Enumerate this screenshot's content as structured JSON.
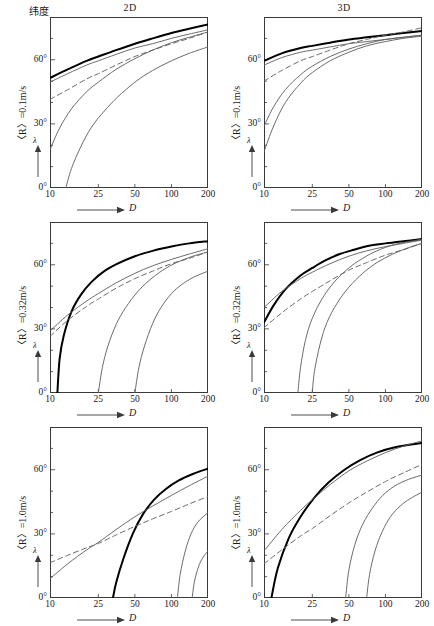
{
  "figure": {
    "width": 426,
    "height": 622,
    "top_left_label": "纬度",
    "column_headers": [
      "2D",
      "3D"
    ],
    "axis": {
      "x_name": "D",
      "y_name": "λ",
      "x_ticks": [
        "10",
        "25",
        "50",
        "100",
        "200"
      ],
      "x_tick_values": [
        10,
        25,
        50,
        100,
        200
      ],
      "y_ticks": [
        "0°",
        "30°",
        "60°"
      ],
      "y_tick_values": [
        0,
        30,
        60
      ],
      "x_scale": "log",
      "x_range": [
        10,
        200
      ],
      "y_range": [
        0,
        80
      ],
      "grid": false,
      "legend": "none"
    },
    "row_labels": [
      "〈R〉=0.1m/s",
      "〈R〉=0.32m/s",
      "〈R〉=1.0m/s"
    ],
    "colors": {
      "axis": "#3a3a3a",
      "thick_curve": "#000000",
      "thin_curve": "#5a5a5a",
      "dashed_curve": "#6a6a6a",
      "background": "#ffffff"
    }
  },
  "chart_data": [
    {
      "id": "panel-2d-r01",
      "type": "line",
      "title": "2D",
      "subtitle": "〈R〉=0.1m/s",
      "xlabel": "D",
      "ylabel": "λ",
      "xscale": "log",
      "xlim": [
        10,
        200
      ],
      "ylim": [
        0,
        80
      ],
      "x_ticks": [
        10,
        25,
        50,
        100,
        200
      ],
      "y_ticks": [
        0,
        30,
        60
      ],
      "series": [
        {
          "name": "thick-solid",
          "style": "thick-solid",
          "x": [
            10,
            14,
            20,
            25,
            35,
            50,
            70,
            100,
            140,
            200
          ],
          "y": [
            51.5,
            55.5,
            59.5,
            61.5,
            64.5,
            67.5,
            70.0,
            72.5,
            74.5,
            76.5
          ]
        },
        {
          "name": "thin-solid-upper",
          "style": "thin-solid",
          "x": [
            10,
            14,
            20,
            25,
            35,
            50,
            70,
            100,
            140,
            200
          ],
          "y": [
            49.5,
            53.5,
            57.5,
            59.5,
            62.5,
            65.5,
            67.5,
            70.0,
            72.0,
            74.0
          ]
        },
        {
          "name": "dashed",
          "style": "dashed",
          "x": [
            10,
            14,
            20,
            25,
            35,
            50,
            70,
            100,
            140,
            200
          ],
          "y": [
            41.5,
            46.0,
            51.0,
            53.5,
            57.5,
            61.5,
            64.5,
            67.5,
            70.0,
            73.0
          ]
        },
        {
          "name": "thin-solid-mid",
          "style": "thin-solid",
          "x": [
            10,
            12,
            15,
            20,
            25,
            35,
            50,
            70,
            100,
            140,
            200
          ],
          "y": [
            18.0,
            28.0,
            37.0,
            45.0,
            49.5,
            55.5,
            60.5,
            64.5,
            68.0,
            70.5,
            73.0
          ]
        },
        {
          "name": "thin-solid-lower",
          "style": "thin-solid",
          "x": [
            13.5,
            15,
            18,
            22,
            28,
            36,
            50,
            70,
            100,
            140,
            200
          ],
          "y": [
            0.0,
            9.0,
            19.5,
            28.5,
            36.0,
            42.5,
            49.5,
            55.0,
            59.5,
            63.0,
            66.0
          ]
        }
      ]
    },
    {
      "id": "panel-3d-r01",
      "type": "line",
      "title": "3D",
      "subtitle": "〈R〉=0.1m/s",
      "xlabel": "D",
      "ylabel": "λ",
      "xscale": "log",
      "xlim": [
        10,
        200
      ],
      "ylim": [
        0,
        80
      ],
      "x_ticks": [
        10,
        25,
        50,
        100,
        200
      ],
      "y_ticks": [
        0,
        30,
        60
      ],
      "series": [
        {
          "name": "thick-solid",
          "style": "thick-solid",
          "x": [
            10,
            14,
            20,
            25,
            35,
            50,
            70,
            100,
            140,
            200
          ],
          "y": [
            59.5,
            63.0,
            65.5,
            66.5,
            68.0,
            69.5,
            70.5,
            71.5,
            72.5,
            73.5
          ]
        },
        {
          "name": "thin-solid-upper",
          "style": "thin-solid",
          "x": [
            10,
            14,
            20,
            25,
            35,
            50,
            70,
            100,
            140,
            200
          ],
          "y": [
            57.5,
            61.0,
            63.5,
            64.5,
            66.0,
            67.5,
            68.5,
            69.5,
            70.5,
            71.5
          ]
        },
        {
          "name": "dashed",
          "style": "dashed",
          "x": [
            10,
            14,
            20,
            25,
            35,
            50,
            70,
            100,
            140,
            200
          ],
          "y": [
            50.0,
            55.0,
            59.5,
            61.5,
            64.5,
            67.5,
            69.5,
            71.5,
            73.0,
            75.0
          ]
        },
        {
          "name": "thin-solid-mid",
          "style": "thin-solid",
          "x": [
            10,
            12,
            15,
            20,
            25,
            35,
            50,
            70,
            100,
            140,
            200
          ],
          "y": [
            29.0,
            38.0,
            46.0,
            53.0,
            57.0,
            61.5,
            65.0,
            67.5,
            69.5,
            70.5,
            71.5
          ]
        },
        {
          "name": "thin-solid-lower",
          "style": "thin-solid",
          "x": [
            10,
            12,
            15,
            20,
            25,
            35,
            50,
            70,
            100,
            140,
            200
          ],
          "y": [
            17.0,
            29.0,
            40.0,
            49.0,
            54.0,
            59.5,
            63.5,
            66.5,
            68.5,
            70.0,
            71.0
          ]
        }
      ]
    },
    {
      "id": "panel-2d-r032",
      "type": "line",
      "title": "2D",
      "subtitle": "〈R〉=0.32m/s",
      "xlabel": "D",
      "ylabel": "λ",
      "xscale": "log",
      "xlim": [
        10,
        200
      ],
      "ylim": [
        0,
        80
      ],
      "x_ticks": [
        10,
        25,
        50,
        100,
        200
      ],
      "y_ticks": [
        0,
        30,
        60
      ],
      "series": [
        {
          "name": "thick-solid",
          "style": "thick-solid",
          "x": [
            11.5,
            12,
            13,
            15,
            18,
            22,
            28,
            36,
            50,
            70,
            100,
            140,
            200
          ],
          "y": [
            0.0,
            16.0,
            27.0,
            38.0,
            46.0,
            52.0,
            57.0,
            60.5,
            64.0,
            66.5,
            68.5,
            70.0,
            71.0
          ]
        },
        {
          "name": "thin-solid-upper",
          "style": "thin-solid",
          "x": [
            10,
            14,
            20,
            25,
            35,
            50,
            70,
            100,
            140,
            200
          ],
          "y": [
            29.0,
            36.5,
            43.0,
            46.5,
            51.5,
            56.0,
            59.5,
            62.5,
            65.0,
            67.5
          ]
        },
        {
          "name": "dashed",
          "style": "dashed",
          "x": [
            10,
            14,
            20,
            25,
            35,
            50,
            70,
            100,
            140,
            200
          ],
          "y": [
            26.5,
            34.0,
            40.5,
            44.0,
            49.0,
            53.5,
            57.0,
            60.5,
            63.0,
            66.0
          ]
        },
        {
          "name": "thin-solid-mid",
          "style": "thin-solid",
          "x": [
            25,
            27,
            30,
            35,
            42,
            52,
            65,
            85,
            110,
            150,
            200
          ],
          "y": [
            0.0,
            12.0,
            22.0,
            32.0,
            40.0,
            47.0,
            52.5,
            57.5,
            61.0,
            64.0,
            66.0
          ]
        },
        {
          "name": "thin-solid-lower",
          "style": "thin-solid",
          "x": [
            50,
            54,
            60,
            70,
            82,
            100,
            120,
            150,
            200
          ],
          "y": [
            0.0,
            12.0,
            22.0,
            32.5,
            40.0,
            46.5,
            50.5,
            54.0,
            57.0
          ]
        }
      ]
    },
    {
      "id": "panel-3d-r032",
      "type": "line",
      "title": "3D",
      "subtitle": "〈R〉=0.32m/s",
      "xlabel": "D",
      "ylabel": "λ",
      "xscale": "log",
      "xlim": [
        10,
        200
      ],
      "ylim": [
        0,
        80
      ],
      "x_ticks": [
        10,
        25,
        50,
        100,
        200
      ],
      "y_ticks": [
        0,
        30,
        60
      ],
      "series": [
        {
          "name": "thick-solid",
          "style": "thick-solid",
          "x": [
            10,
            12,
            15,
            20,
            25,
            32,
            42,
            55,
            75,
            100,
            140,
            200
          ],
          "y": [
            33.0,
            41.0,
            48.5,
            55.0,
            58.5,
            62.0,
            65.0,
            67.0,
            69.0,
            70.0,
            71.0,
            72.0
          ]
        },
        {
          "name": "thin-solid-upper",
          "style": "thin-solid",
          "x": [
            10,
            14,
            20,
            25,
            35,
            50,
            70,
            100,
            140,
            200
          ],
          "y": [
            40.0,
            47.5,
            53.5,
            56.5,
            60.5,
            64.0,
            66.5,
            68.5,
            70.0,
            71.5
          ]
        },
        {
          "name": "dashed",
          "style": "dashed",
          "x": [
            10,
            14,
            20,
            25,
            35,
            50,
            70,
            100,
            140,
            200
          ],
          "y": [
            30.5,
            37.5,
            44.0,
            47.5,
            52.5,
            57.5,
            61.0,
            64.5,
            67.0,
            70.0
          ]
        },
        {
          "name": "thin-solid-mid",
          "style": "thin-solid",
          "x": [
            19,
            20,
            22,
            25,
            30,
            38,
            50,
            65,
            85,
            120,
            200
          ],
          "y": [
            0.0,
            12.0,
            25.0,
            35.0,
            44.0,
            52.0,
            58.5,
            63.0,
            66.5,
            69.5,
            72.0
          ]
        },
        {
          "name": "thin-solid-lower",
          "style": "thin-solid",
          "x": [
            25,
            26,
            29,
            33,
            40,
            50,
            65,
            85,
            115,
            155,
            200
          ],
          "y": [
            0.0,
            10.0,
            23.0,
            33.0,
            42.0,
            49.5,
            56.0,
            61.0,
            65.0,
            68.0,
            70.0
          ]
        }
      ]
    },
    {
      "id": "panel-2d-r10",
      "type": "line",
      "title": "2D",
      "subtitle": "〈R〉=1.0m/s",
      "xlabel": "D",
      "ylabel": "λ",
      "xscale": "log",
      "xlim": [
        10,
        200
      ],
      "ylim": [
        0,
        80
      ],
      "x_ticks": [
        10,
        25,
        50,
        100,
        200
      ],
      "y_ticks": [
        0,
        30,
        60
      ],
      "series": [
        {
          "name": "thick-solid",
          "style": "thick-solid",
          "x": [
            33,
            35,
            40,
            48,
            58,
            72,
            90,
            115,
            150,
            200
          ],
          "y": [
            0.0,
            7.0,
            18.0,
            30.0,
            39.0,
            46.0,
            51.0,
            55.0,
            58.0,
            60.5
          ]
        },
        {
          "name": "thin-solid-upper",
          "style": "thin-solid",
          "x": [
            10,
            14,
            20,
            25,
            35,
            50,
            70,
            100,
            140,
            200
          ],
          "y": [
            9.0,
            16.0,
            22.5,
            26.0,
            32.0,
            38.0,
            43.0,
            48.0,
            52.5,
            57.0
          ]
        },
        {
          "name": "dashed",
          "style": "dashed",
          "x": [
            10,
            14,
            20,
            25,
            35,
            50,
            70,
            100,
            140,
            200
          ],
          "y": [
            16.5,
            20.0,
            23.5,
            25.5,
            29.5,
            33.5,
            37.0,
            40.5,
            44.0,
            47.5
          ]
        },
        {
          "name": "thin-solid-mid",
          "style": "thin-solid",
          "x": [
            112,
            118,
            130,
            145,
            165,
            200
          ],
          "y": [
            0.0,
            11.0,
            22.0,
            30.0,
            35.5,
            40.0
          ]
        },
        {
          "name": "thin-solid-lower",
          "style": "thin-solid",
          "x": [
            148,
            155,
            168,
            182,
            200
          ],
          "y": [
            0.0,
            8.0,
            15.0,
            19.0,
            22.0
          ]
        }
      ]
    },
    {
      "id": "panel-3d-r10",
      "type": "line",
      "title": "3D",
      "subtitle": "〈R〉=1.0m/s",
      "xlabel": "D",
      "ylabel": "λ",
      "xscale": "log",
      "xlim": [
        10,
        200
      ],
      "ylim": [
        0,
        80
      ],
      "x_ticks": [
        10,
        25,
        50,
        100,
        200
      ],
      "y_ticks": [
        0,
        30,
        60
      ],
      "series": [
        {
          "name": "thick-solid",
          "style": "thick-solid",
          "x": [
            11.5,
            13,
            16,
            20,
            26,
            34,
            46,
            62,
            85,
            120,
            200
          ],
          "y": [
            0.0,
            14.0,
            28.0,
            38.0,
            47.0,
            54.0,
            60.0,
            64.5,
            68.0,
            70.5,
            72.5
          ]
        },
        {
          "name": "thin-solid-upper",
          "style": "thin-solid",
          "x": [
            10,
            14,
            20,
            25,
            35,
            50,
            70,
            100,
            140,
            200
          ],
          "y": [
            22.0,
            32.0,
            41.0,
            46.0,
            53.0,
            59.5,
            64.0,
            68.0,
            71.0,
            73.5
          ]
        },
        {
          "name": "dashed",
          "style": "dashed",
          "x": [
            10,
            14,
            20,
            25,
            35,
            50,
            70,
            100,
            140,
            200
          ],
          "y": [
            16.0,
            22.5,
            29.0,
            32.5,
            38.5,
            44.5,
            49.5,
            54.5,
            58.5,
            62.5
          ]
        },
        {
          "name": "thin-solid-mid",
          "style": "thin-solid",
          "x": [
            47,
            50,
            56,
            65,
            78,
            95,
            120,
            155,
            200
          ],
          "y": [
            0.0,
            13.0,
            25.0,
            34.5,
            42.0,
            48.0,
            52.5,
            55.5,
            57.5
          ]
        },
        {
          "name": "thin-solid-lower",
          "style": "thin-solid",
          "x": [
            70,
            74,
            82,
            94,
            110,
            132,
            160,
            200
          ],
          "y": [
            0.0,
            11.0,
            22.0,
            31.0,
            38.0,
            43.0,
            46.5,
            49.5
          ]
        }
      ]
    }
  ]
}
